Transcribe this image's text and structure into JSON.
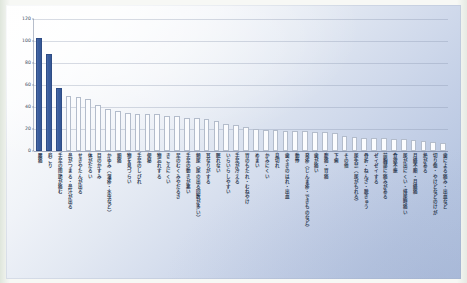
{
  "chart_data": {
    "type": "bar",
    "title": "",
    "subtitle": "",
    "xlabel": "",
    "ylabel": "",
    "ylim": [
      0,
      120
    ],
    "yticks": [
      0,
      20,
      40,
      60,
      80,
      100,
      120
    ],
    "grid": true,
    "legend": "none",
    "highlight_color": "#3b5e9e",
    "bar_color": "#fbfcfe",
    "highlighted_indices": [
      0,
      1,
      2
    ],
    "categories": [
      "腰痛",
      "肩こり",
      "手足の関節が痛む",
      "鼻がつまる・鼻汁が出る",
      "せきやたんが出る",
      "体がだるい",
      "目のかすみ",
      "かゆみ（湿疹・水虫など）",
      "頭痛",
      "物を見づらい",
      "手足のしびれ",
      "便秘",
      "物忘れする",
      "きこえにくい",
      "足のむくみやだるさ",
      "手足の動きが悪い",
      "頻尿（尿の出る回数が多い）",
      "耳なりがする",
      "眠れない",
      "いらいらしやすい",
      "手足が冷える",
      "胃のもたれ・むねやけ",
      "めまい",
      "かみにくい",
      "息切れ",
      "歯ぐきのはれ・出血",
      "動悸",
      "発疹（じんま疹・できものなど）",
      "歯が痛い",
      "腹痛・胃痛",
      "下痢",
      "その他",
      "尿失禁（尿がもれる）",
      "骨折・ねんざ・脱きゅう",
      "ゼイゼイする",
      "前胸部に痛みがある",
      "食欲不振",
      "尿が出にくい・排尿時痛い",
      "月経不順・月経痛",
      "熱がある",
      "切り傷・やけどなどのけが",
      "歯による痛み・出血など"
    ],
    "values": [
      103,
      88,
      57,
      50,
      49,
      47,
      42,
      38,
      36,
      35,
      34,
      34,
      34,
      32,
      32,
      30,
      30,
      29,
      27,
      25,
      24,
      22,
      20,
      19,
      19,
      18,
      18,
      18,
      17,
      17,
      16,
      14,
      13,
      12,
      12,
      12,
      11,
      11,
      10,
      9,
      8,
      7
    ]
  },
  "yaxis": {
    "ticks": [
      "0",
      "20",
      "40",
      "60",
      "80",
      "100",
      "120"
    ]
  }
}
